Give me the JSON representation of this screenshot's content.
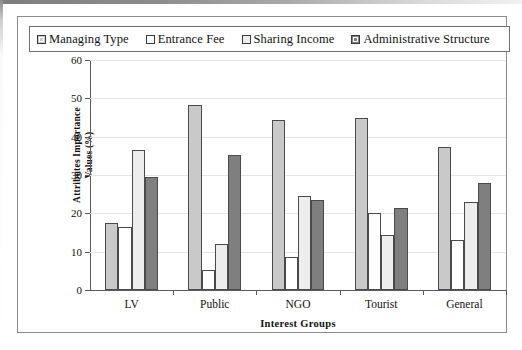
{
  "legend": {
    "items": [
      {
        "label": "Managing Type",
        "color": "#c9c9c9",
        "style": "inner-border"
      },
      {
        "label": "Entrance Fee",
        "color": "#ffffff",
        "style": "plain"
      },
      {
        "label": "Sharing Income",
        "color": "#ededed",
        "style": "plain"
      },
      {
        "label": "Administrative Structure",
        "color": "#7f7f7f",
        "style": "inner-border"
      }
    ]
  },
  "chart_data": {
    "type": "bar",
    "title": "",
    "xlabel": "Interest Groups",
    "ylabel": "Attributes Importance Values (%)",
    "categories": [
      "LV",
      "Public",
      "NGO",
      "Tourist",
      "General"
    ],
    "series": [
      {
        "name": "Managing Type",
        "color": "#c9c9c9",
        "values": [
          17.5,
          48.2,
          44.4,
          45.0,
          37.3
        ]
      },
      {
        "name": "Entrance Fee",
        "color": "#ffffff",
        "values": [
          16.5,
          5.3,
          8.7,
          20.0,
          13.0
        ]
      },
      {
        "name": "Sharing Income",
        "color": "#ededed",
        "values": [
          36.6,
          12.0,
          24.5,
          14.3,
          23.0
        ]
      },
      {
        "name": "Administrative Structure",
        "color": "#7f7f7f",
        "values": [
          29.5,
          35.1,
          23.5,
          21.5,
          28.0
        ]
      }
    ],
    "ylim": [
      0,
      60
    ],
    "yticks": [
      0,
      10,
      20,
      30,
      40,
      50,
      60
    ],
    "ytick_labels": [
      "0",
      "10",
      "20",
      "30",
      "40",
      "50",
      "60"
    ],
    "grid": "horizontal",
    "legend_position": "top"
  }
}
